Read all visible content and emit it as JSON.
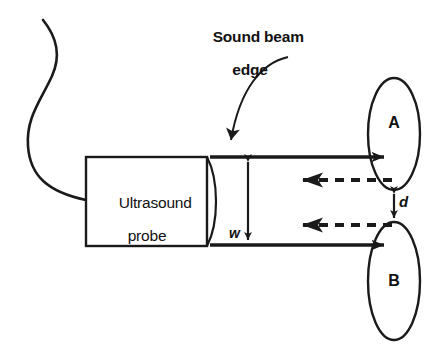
{
  "figure": {
    "background_color": "#ffffff",
    "ink_color": "#1a1a1a"
  },
  "labels": {
    "sound_beam_edge_line1": "Sound beam",
    "sound_beam_edge_line2": "edge",
    "probe_line1": "Ultrasound",
    "probe_line2": "probe",
    "beam_width_symbol": "w",
    "separation_symbol": "d",
    "reflector_a": "A",
    "reflector_b": "B"
  },
  "shapes": {
    "probe_box": {
      "x": 86,
      "y": 157,
      "width": 121,
      "height": 89
    },
    "lens_bulge_x": 222,
    "cable": {
      "start_x": 43,
      "start_y": 20,
      "end_x": 86,
      "end_y": 200
    },
    "reflector_a_ellipse": {
      "cx": 394,
      "cy": 134,
      "rx": 26,
      "ry": 56
    },
    "reflector_b_ellipse": {
      "cx": 394,
      "cy": 281,
      "rx": 26,
      "ry": 59
    },
    "beam_edge_top_y": 157,
    "beam_edge_bottom_y": 245,
    "beam_start_x": 210,
    "beam_end_x": 388,
    "width_arrow_x": 248,
    "separation_arrow": {
      "x": 394,
      "y_top": 190,
      "y_bottom": 222
    },
    "echo_top_y": 180,
    "echo_bottom_y": 225,
    "pointer_arrow": {
      "start_x": 288,
      "start_y": 57,
      "tip_x": 228,
      "tip_y": 154
    }
  }
}
